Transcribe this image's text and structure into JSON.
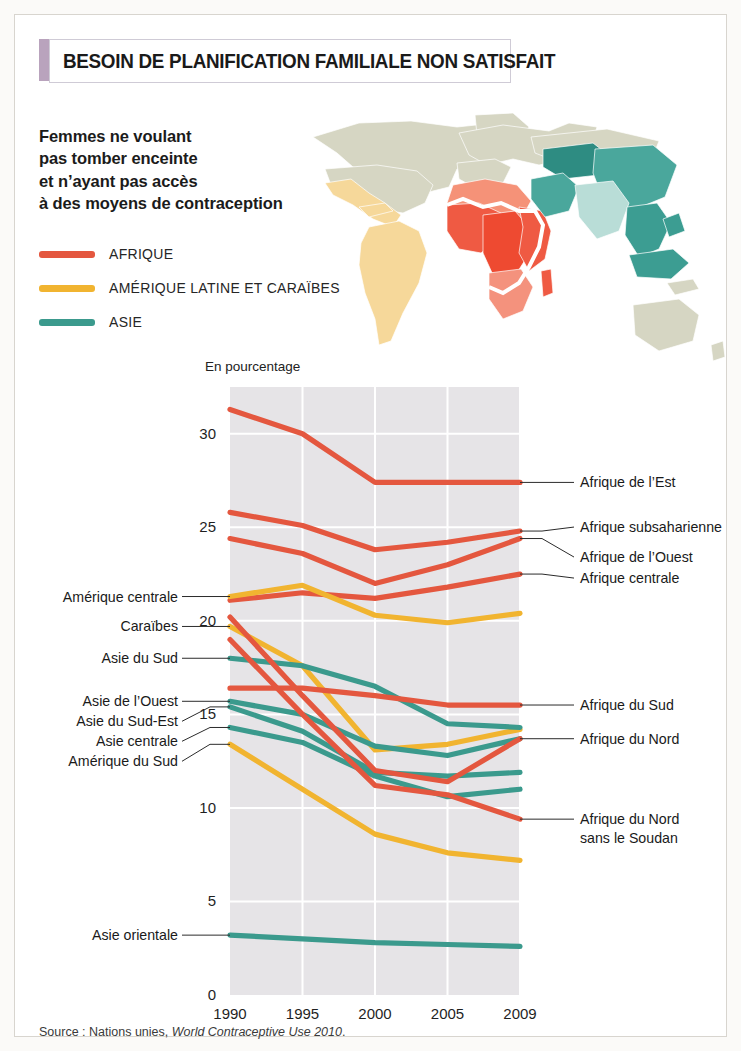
{
  "header": {
    "title": "BESOIN DE PLANIFICATION FAMILIALE NON SATISFAIT",
    "accent_color": "#b9a3bd"
  },
  "subtitle": {
    "line1": "Femmes ne voulant",
    "line2": "pas tomber enceinte",
    "line3": "et n’ayant pas accès",
    "line4": "à des moyens de contraception"
  },
  "legend": [
    {
      "label": "AFRIQUE",
      "color": "#e4573f"
    },
    {
      "label": "AMÉRIQUE LATINE ET CARAÏBES",
      "color": "#f1b430"
    },
    {
      "label": "ASIE",
      "color": "#3b9a8d"
    }
  ],
  "map": {
    "name": "world-map",
    "land_color": "#d6d6c3",
    "regions": [
      {
        "name": "Afrique subsaharienne",
        "color": "#ef5a43"
      },
      {
        "name": "Afrique centrale",
        "color": "#ee4a31"
      },
      {
        "name": "Afrique du Nord",
        "color": "#f59278"
      },
      {
        "name": "Afrique australe",
        "color": "#f4927d"
      },
      {
        "name": "Amérique latine",
        "color": "#f6d89a"
      },
      {
        "name": "Asie centrale",
        "color": "#2e8c82"
      },
      {
        "name": "Asie de l’Est",
        "color": "#4aa79c"
      },
      {
        "name": "Asie du Sud",
        "color": "#b9ddd7"
      },
      {
        "name": "Asie du Sud-Est",
        "color": "#3c9d92"
      }
    ]
  },
  "source": {
    "prefix": "Source : Nations unies, ",
    "italic": "World Contraceptive Use 2010",
    "suffix": "."
  },
  "chart_data": {
    "type": "line",
    "title": "BESOIN DE PLANIFICATION FAMILIALE NON SATISFAIT",
    "subtitle": "Femmes ne voulant pas tomber enceinte et n’ayant pas accès à des moyens de contraception",
    "ylabel": "En pourcentage",
    "xlabel": "",
    "x": [
      1990,
      1995,
      2000,
      2005,
      2009
    ],
    "xticklabels": [
      "1990",
      "1995",
      "2000",
      "2005",
      "2009"
    ],
    "yticks": [
      0,
      5,
      10,
      15,
      20,
      25,
      30
    ],
    "ylim": [
      0,
      32.5
    ],
    "grid": true,
    "legend_position": "top-left",
    "series": [
      {
        "name": "Afrique de l’Est",
        "group": "AFRIQUE",
        "color": "#e4573f",
        "label_side": "right",
        "values": [
          31.3,
          30.0,
          27.4,
          27.4,
          27.4
        ]
      },
      {
        "name": "Afrique subsaharienne",
        "group": "AFRIQUE",
        "color": "#e4573f",
        "label_side": "right",
        "values": [
          25.8,
          25.1,
          23.8,
          24.2,
          24.8
        ]
      },
      {
        "name": "Afrique de l’Ouest",
        "group": "AFRIQUE",
        "color": "#e4573f",
        "label_side": "right",
        "values": [
          24.4,
          23.6,
          22.0,
          23.0,
          24.4
        ]
      },
      {
        "name": "Afrique centrale",
        "group": "AFRIQUE",
        "color": "#e4573f",
        "label_side": "right",
        "values": [
          21.1,
          21.5,
          21.2,
          21.8,
          22.5
        ]
      },
      {
        "name": "Amérique centrale",
        "group": "AMÉRIQUE LATINE ET CARAÏBES",
        "color": "#f1b430",
        "label_side": "left",
        "values": [
          21.3,
          21.9,
          20.3,
          19.9,
          20.4
        ]
      },
      {
        "name": "Caraïbes",
        "group": "AMÉRIQUE LATINE ET CARAÏBES",
        "color": "#f1b430",
        "label_side": "left",
        "values": [
          19.7,
          17.6,
          13.1,
          13.4,
          14.2
        ]
      },
      {
        "name": "Asie du Sud",
        "group": "ASIE",
        "color": "#3b9a8d",
        "label_side": "left",
        "values": [
          18.0,
          17.6,
          16.5,
          14.5,
          14.3
        ]
      },
      {
        "name": "Afrique du Sud",
        "group": "AFRIQUE",
        "color": "#e4573f",
        "label_side": "right",
        "values": [
          16.4,
          16.4,
          16.0,
          15.5,
          15.5
        ]
      },
      {
        "name": "Asie de l’Ouest",
        "group": "ASIE",
        "color": "#3b9a8d",
        "label_side": "left",
        "values": [
          15.7,
          15.0,
          13.3,
          12.8,
          13.7
        ]
      },
      {
        "name": "Asie du Sud-Est",
        "group": "ASIE",
        "color": "#3b9a8d",
        "label_side": "left",
        "values": [
          15.4,
          14.1,
          11.9,
          11.7,
          11.9
        ]
      },
      {
        "name": "Asie centrale",
        "group": "ASIE",
        "color": "#3b9a8d",
        "label_side": "left",
        "values": [
          14.3,
          13.5,
          11.7,
          10.6,
          11.0
        ]
      },
      {
        "name": "Afrique du Nord",
        "group": "AFRIQUE",
        "color": "#e4573f",
        "label_side": "right",
        "values": [
          20.2,
          16.0,
          12.0,
          11.4,
          13.7
        ]
      },
      {
        "name": "Afrique du Nord sans le Soudan",
        "group": "AFRIQUE",
        "color": "#e4573f",
        "label_side": "right",
        "values": [
          19.0,
          15.0,
          11.2,
          10.7,
          9.4
        ]
      },
      {
        "name": "Amérique du Sud",
        "group": "AMÉRIQUE LATINE ET CARAÏBES",
        "color": "#f1b430",
        "label_side": "left",
        "values": [
          13.4,
          11.0,
          8.6,
          7.6,
          7.2
        ]
      },
      {
        "name": "Asie orientale",
        "group": "ASIE",
        "color": "#3b9a8d",
        "label_side": "left",
        "values": [
          3.2,
          3.0,
          2.8,
          2.7,
          2.6
        ]
      }
    ],
    "left_labels": [
      "Amérique centrale",
      "Caraïbes",
      "Asie du Sud",
      "Asie de l’Ouest",
      "Asie du Sud-Est",
      "Asie centrale",
      "Amérique du Sud",
      "Asie orientale"
    ],
    "right_labels": [
      "Afrique de l’Est",
      "Afrique subsaharienne",
      "Afrique de l’Ouest",
      "Afrique centrale",
      "Afrique du Sud",
      "Afrique du Nord",
      "Afrique du Nord sans le Soudan"
    ]
  }
}
